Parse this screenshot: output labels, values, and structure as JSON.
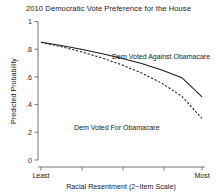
{
  "chart_data": {
    "type": "line",
    "title": "2010 Democratic Vote Preference for the House",
    "xlabel": "Racial Resentment (2−Item Scale)",
    "ylabel": "Predicted Probability",
    "xlim": [
      0,
      1
    ],
    "ylim": [
      0,
      1
    ],
    "grid": false,
    "legend": "inline annotations",
    "x_tick_labels": [
      "Least",
      "",
      "",
      "",
      "Most"
    ],
    "x_tick_positions": [
      0,
      0.25,
      0.5,
      0.75,
      1
    ],
    "y_tick_labels": [
      "0",
      ".2",
      ".4",
      ".6",
      ".8",
      "1"
    ],
    "y_tick_positions": [
      0,
      0.2,
      0.4,
      0.6,
      0.8,
      1
    ],
    "x": [
      0,
      0.125,
      0.25,
      0.375,
      0.5,
      0.625,
      0.75,
      0.875,
      1
    ],
    "series": [
      {
        "name": "Dem Voted Against Obamacare",
        "style": "solid",
        "values": [
          0.85,
          0.826,
          0.799,
          0.769,
          0.735,
          0.696,
          0.65,
          0.594,
          0.455
        ],
        "annotation": "Dem Voted Against Obamacare"
      },
      {
        "name": "Dem Voted For Obamacare",
        "style": "dashed",
        "values": [
          0.85,
          0.818,
          0.781,
          0.738,
          0.688,
          0.628,
          0.555,
          0.46,
          0.3
        ],
        "annotation": "Dem Voted For Obamacare"
      }
    ]
  },
  "figure": {
    "title": "2010 Democratic Vote Preference for the House",
    "y_axis_title": "Predicted Probability",
    "x_axis_title": "Racial Resentment (2−Item Scale)",
    "y_ticks": {
      "t0": "0",
      "t1": ".2",
      "t2": ".4",
      "t3": ".6",
      "t4": ".8",
      "t5": "1"
    },
    "x_ticks": {
      "least": "Least",
      "most": "Most"
    },
    "annotations": {
      "against": "Dem Voted Against Obamacare",
      "for": "Dem Voted For Obamacare"
    },
    "colors": {
      "line": "#1a1a1a",
      "axis": "#555555",
      "background": "#ffffff"
    }
  }
}
